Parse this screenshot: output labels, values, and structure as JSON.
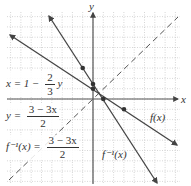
{
  "chart_data": {
    "type": "line",
    "title": "",
    "xlabel": "x",
    "ylabel": "y",
    "xlim": [
      -8,
      9
    ],
    "ylim": [
      -8,
      8
    ],
    "grid": true,
    "series": [
      {
        "name": "f(x)",
        "equation": "x = 1 - (2/3) y",
        "style": "solid",
        "points": [
          [
            -6,
            5
          ],
          [
            0,
            1
          ],
          [
            1.5,
            0
          ],
          [
            3,
            -1
          ],
          [
            8,
            -4.33
          ]
        ]
      },
      {
        "name": "f^-1(x)",
        "equation": "y = (3 - 3x)/2",
        "style": "solid",
        "points": [
          [
            -3,
            6
          ],
          [
            -1,
            3
          ],
          [
            0,
            1.5
          ],
          [
            1,
            0
          ],
          [
            6,
            -7.5
          ]
        ]
      },
      {
        "name": "y = x",
        "style": "dashed",
        "points": [
          [
            -8,
            -8
          ],
          [
            8,
            8
          ]
        ]
      }
    ],
    "marked_points": [
      [
        -1,
        3
      ],
      [
        0,
        1.5
      ],
      [
        0,
        1
      ],
      [
        1,
        0
      ],
      [
        3,
        -1
      ]
    ],
    "annotations": [
      "x = 1 - 2/3 y",
      "y = (3 - 3x)/2",
      "f^-1(x) = (3 - 3x)/2",
      "f(x)",
      "f^-1(x)"
    ]
  },
  "labels": {
    "x_axis": "x",
    "y_axis": "y",
    "eq1_left": "x = 1 −",
    "eq1_num": "2",
    "eq1_den": "3",
    "eq1_right": "y",
    "eq2_left": "y =",
    "eq2_num": "3 − 3x",
    "eq2_den": "2",
    "eq3_left": "f⁻¹(x) =",
    "eq3_num": "3 − 3x",
    "eq3_den": "2",
    "f_label": "f(x)",
    "finv_label": "f⁻¹(x)"
  }
}
